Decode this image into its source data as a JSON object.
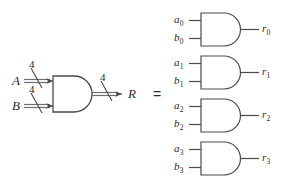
{
  "figure": {
    "equals_symbol": "=",
    "colors": {
      "line": "#4a4a4a",
      "bus": "#6e6e6e",
      "text": "#2b2b2b",
      "background": "#ffffff"
    }
  },
  "left": {
    "gate_type": "AND",
    "inputs": [
      {
        "label": "A",
        "width_label": "4"
      },
      {
        "label": "B",
        "width_label": "4"
      }
    ],
    "output": {
      "label": "R",
      "width_label": "4"
    }
  },
  "right": {
    "gates": [
      {
        "gate_type": "AND",
        "input_a": "a",
        "input_a_sub": "0",
        "input_b": "b",
        "input_b_sub": "0",
        "output": "r",
        "output_sub": "0"
      },
      {
        "gate_type": "AND",
        "input_a": "a",
        "input_a_sub": "1",
        "input_b": "b",
        "input_b_sub": "1",
        "output": "r",
        "output_sub": "1"
      },
      {
        "gate_type": "AND",
        "input_a": "a",
        "input_a_sub": "2",
        "input_b": "b",
        "input_b_sub": "2",
        "output": "r",
        "output_sub": "2"
      },
      {
        "gate_type": "AND",
        "input_a": "a",
        "input_a_sub": "3",
        "input_b": "b",
        "input_b_sub": "3",
        "output": "r",
        "output_sub": "3"
      }
    ]
  }
}
